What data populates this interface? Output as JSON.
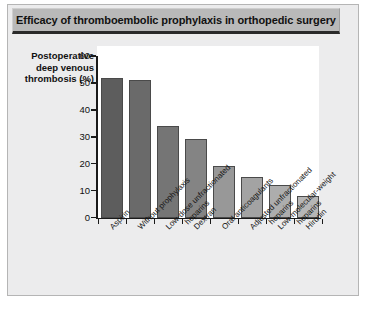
{
  "figure": {
    "title": "Efficacy of thromboembolic prophylaxis in orthopedic surgery",
    "ylabel_line1": "Postoperative",
    "ylabel_line2": "deep venous",
    "ylabel_line3": "thrombosis (%)",
    "banner_color": "#b9b9b9",
    "panel_color": "#ececed",
    "plot_bg": "#ffffff",
    "axis_color": "#1a1a1a"
  },
  "chart_data": {
    "type": "bar",
    "title": "Efficacy of thromboembolic prophylaxis in orthopedic surgery",
    "xlabel": "",
    "ylabel": "Postoperative deep venous thrombosis (%)",
    "ylim": [
      0,
      60
    ],
    "yticks": [
      0,
      10,
      20,
      30,
      40,
      50,
      60
    ],
    "ytick_labels": [
      "0",
      "10",
      "20",
      "30",
      "40",
      "50",
      "60"
    ],
    "grid": false,
    "legend": null,
    "categories": [
      "Aspirin",
      "Without prophylaxis",
      "Low-dose unfractionated heparins",
      "Dextran",
      "Oral anticoagulants",
      "Adjusted unfractionated heparins",
      "Low-molecular-weight heparins",
      "Hirudin"
    ],
    "category_lines": [
      [
        "Aspirin"
      ],
      [
        "Without prophylaxis"
      ],
      [
        "Low-dose unfractionated",
        "heparins"
      ],
      [
        "Dextran"
      ],
      [
        "Oral anticoagulants"
      ],
      [
        "Adjusted unfractionated",
        "heparins"
      ],
      [
        "Low-molecular-weight",
        "heparins"
      ],
      [
        "Hirudin"
      ]
    ],
    "values": [
      52,
      51,
      34,
      29,
      19,
      15,
      12,
      8
    ],
    "bar_colors": [
      "#5d5d5d",
      "#6a6a6a",
      "#757575",
      "#848484",
      "#989898",
      "#a3a3a3",
      "#adadad",
      "#b6b6b6"
    ]
  }
}
